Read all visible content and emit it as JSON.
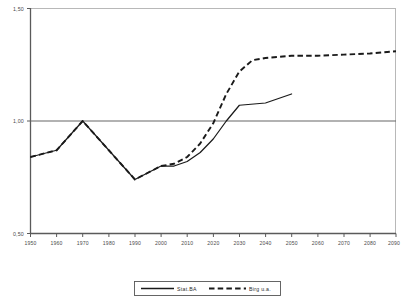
{
  "chart_data": {
    "type": "line",
    "title": "",
    "subtitle": "",
    "xlabel": "",
    "ylabel": "",
    "xlim": [
      1950,
      2090
    ],
    "ylim": [
      0.5,
      1.5
    ],
    "grid": false,
    "legend_position": "bottom",
    "x_tick_labels": [
      "1950",
      "1960",
      "1970",
      "1980",
      "1990",
      "2000",
      "2010",
      "2020",
      "2030",
      "2040",
      "2050",
      "2060",
      "2070",
      "2080",
      "2090"
    ],
    "x_ticks": [
      1950,
      1960,
      1970,
      1980,
      1990,
      2000,
      2010,
      2020,
      2030,
      2040,
      2050,
      2060,
      2070,
      2080,
      2090
    ],
    "y_tick_labels": [
      "1,50",
      "1,00",
      "0,50"
    ],
    "y_ticks": [
      1.5,
      1.0,
      0.5
    ],
    "reference_line_y": 1.0,
    "series": [
      {
        "name": "Stat.BA",
        "style": "solid",
        "color": "#1a1a1a",
        "x": [
          1950,
          1960,
          1970,
          1980,
          1990,
          2000,
          2005,
          2010,
          2015,
          2020,
          2025,
          2030,
          2040,
          2050
        ],
        "values": [
          0.84,
          0.87,
          1.0,
          0.87,
          0.74,
          0.8,
          0.8,
          0.82,
          0.86,
          0.92,
          1.0,
          1.07,
          1.08,
          1.12
        ]
      },
      {
        "name": "Birg u.a.",
        "style": "dashed",
        "color": "#1a1a1a",
        "x": [
          1950,
          1960,
          1970,
          1980,
          1990,
          2000,
          2005,
          2010,
          2015,
          2020,
          2025,
          2030,
          2035,
          2040,
          2050,
          2060,
          2070,
          2080,
          2090
        ],
        "values": [
          0.84,
          0.87,
          1.0,
          0.87,
          0.74,
          0.8,
          0.81,
          0.84,
          0.9,
          0.99,
          1.12,
          1.22,
          1.27,
          1.28,
          1.29,
          1.29,
          1.295,
          1.3,
          1.31
        ]
      }
    ]
  },
  "legend": {
    "entries": [
      {
        "label": "Stat.BA",
        "style": "solid"
      },
      {
        "label": "Birg u.a.",
        "style": "dashed"
      }
    ]
  }
}
